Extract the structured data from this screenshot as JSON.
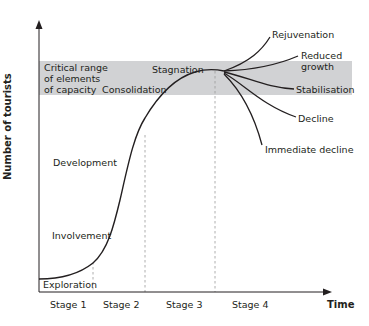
{
  "diagram": {
    "y_axis_label": "Number of tourists",
    "x_axis_label": "Time",
    "band_label_lines": [
      "Critical range",
      "of elements",
      "of capacity"
    ],
    "phases": {
      "exploration": "Exploration",
      "involvement": "Involvement",
      "development": "Development",
      "consolidation": "Consolidation",
      "stagnation": "Stagnation"
    },
    "outcomes": {
      "rejuvenation": "Rejuvenation",
      "reduced_growth_line1": "Reduced",
      "reduced_growth_line2": "growth",
      "stabilisation": "Stabilisation",
      "decline": "Decline",
      "immediate_decline": "Immediate decline"
    },
    "stages": [
      "Stage 1",
      "Stage 2",
      "Stage 3",
      "Stage 4"
    ],
    "colors": {
      "band": "#d1d2d4",
      "line": "#231f20",
      "dashed": "#9a9a9a"
    }
  }
}
